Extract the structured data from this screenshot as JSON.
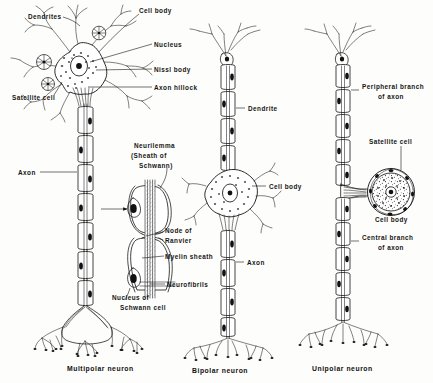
{
  "figure": {
    "background_color": "#fdfdfb",
    "ink_color": "#141414",
    "style": "line drawing / scanned textbook illustration"
  },
  "captions": {
    "multipolar": "Multipolar neuron",
    "bipolar": "Bipolar neuron",
    "unipolar": "Unipolar neuron"
  },
  "labels": {
    "dendrites": "Dendrites",
    "cell_body_top": "Cell body",
    "nucleus": "Nucleus",
    "nissl_body": "Nissl body",
    "axon_hillock": "Axon hillock",
    "satellite_cell_left": "Satellite cell",
    "axon_left": "Axon",
    "neurilemma_l1": "Neurilemma",
    "neurilemma_l2": "(Sheath of",
    "neurilemma_l3": "Schwann)",
    "node_of_ranvier_l1": "Node of",
    "node_of_ranvier_l2": "Ranvier",
    "myelin_sheath": "Myelin sheath",
    "neurofibrils": "Neurofibrils",
    "nucleus_schwann_l1": "Nucleus of",
    "nucleus_schwann_l2": "Schwann cell",
    "dendrite_mid": "Dendrite",
    "cell_body_mid": "Cell body",
    "axon_mid": "Axon",
    "peripheral_branch_l1": "Peripheral branch",
    "peripheral_branch_l2": "of axon",
    "satellite_cell_right": "Satellite cell",
    "cell_body_right": "Cell body",
    "central_branch_l1": "Central branch",
    "central_branch_l2": "of axon"
  },
  "structures": {
    "multipolar": {
      "name": "Multipolar neuron",
      "parts": [
        "Dendrites",
        "Cell body",
        "Nucleus",
        "Nissl body",
        "Axon hillock",
        "Satellite cell",
        "Axon",
        "Axon terminals"
      ],
      "dendrite_count": 7,
      "satellite_cell_count": 3,
      "myelin_segment_count": 7
    },
    "inset": {
      "name": "Myelinated axon detail",
      "parts": [
        "Neurilemma (Sheath of Schwann)",
        "Node of Ranvier",
        "Myelin sheath",
        "Neurofibrils",
        "Nucleus of Schwann cell"
      ],
      "segment_count": 2
    },
    "bipolar": {
      "name": "Bipolar neuron",
      "parts": [
        "Dendrite",
        "Cell body",
        "Axon",
        "Axon terminals"
      ],
      "myelin_segment_count": 8
    },
    "unipolar": {
      "name": "Unipolar neuron",
      "parts": [
        "Peripheral branch of axon",
        "Satellite cell",
        "Cell body",
        "Central branch of axon",
        "Axon terminals"
      ],
      "myelin_segment_count": 10
    }
  }
}
